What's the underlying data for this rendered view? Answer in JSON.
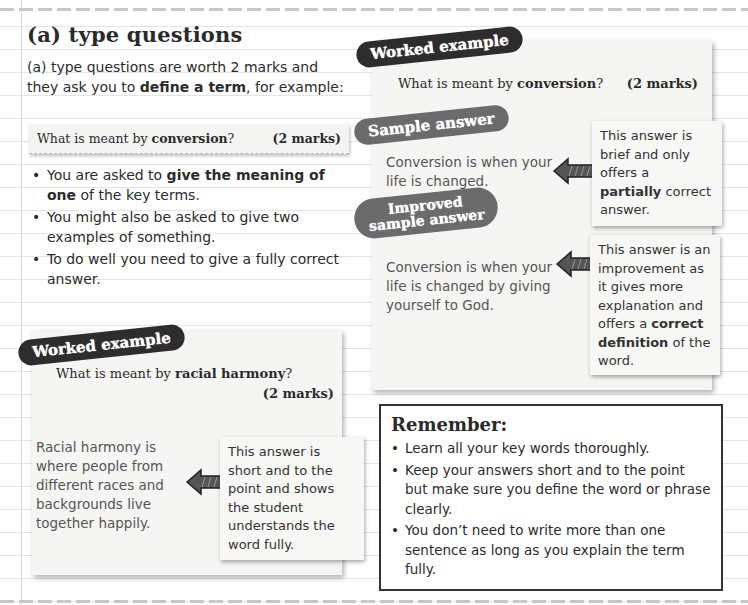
{
  "section": {
    "title": "(a) type questions",
    "intro_prefix": "(a) type questions are worth 2 marks and they ask you to ",
    "intro_bold": "define a term",
    "intro_suffix": ", for example:"
  },
  "example_question": {
    "prefix": "What is meant by ",
    "term": "conversion",
    "suffix": "?",
    "marks": "(2 marks)"
  },
  "bullets": [
    {
      "prefix": "You are asked to ",
      "bold": "give the meaning of one",
      "suffix": " of the key terms."
    },
    {
      "text": "You might also be asked to give two examples of something."
    },
    {
      "text": "To do well you need to give a fully correct answer."
    }
  ],
  "worked_example_1": {
    "badge": "Worked example",
    "question_prefix": "What is meant by ",
    "question_term": "conversion",
    "question_suffix": "?",
    "marks": "(2 marks)",
    "sample": {
      "badge": "Sample answer",
      "answer": "Conversion is when your life is changed.",
      "note_prefix": "This answer is brief and only offers a ",
      "note_bold": "partially",
      "note_suffix": " correct answer."
    },
    "improved": {
      "badge_line1": "Improved",
      "badge_line2": "sample answer",
      "answer": "Conversion is when your life is changed by giving yourself to God.",
      "note_prefix": "This answer is an improvement as it gives more explanation and offers a ",
      "note_bold": "correct definition",
      "note_suffix": " of the word."
    }
  },
  "worked_example_2": {
    "badge": "Worked example",
    "question_prefix": "What is meant by ",
    "question_term": "racial harmony",
    "question_suffix": "?",
    "marks": "(2 marks)",
    "answer": "Racial harmony is where people from different races and backgrounds live together happily.",
    "note": "This answer is short and to the point and shows the student understands the word fully."
  },
  "remember": {
    "title": "Remember:",
    "items": [
      "Learn all your key words thoroughly.",
      "Keep your answers short and to the point but make sure you define the word or phrase clearly.",
      "You don’t need to write more than one sentence as long as you explain the term fully."
    ]
  },
  "colors": {
    "badge_dark": "#2d2d2d",
    "badge_grey": "#6b6b6b",
    "card_bg": "#f5f5f3"
  }
}
